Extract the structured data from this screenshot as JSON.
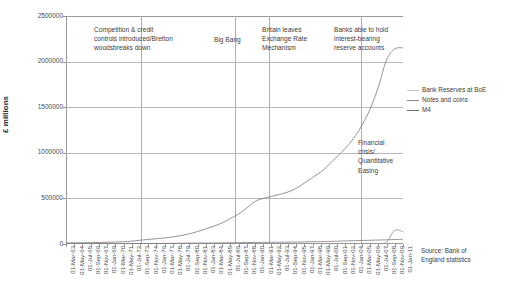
{
  "chart_data": {
    "type": "line",
    "title": "",
    "xlabel": "",
    "ylabel": "£ millions",
    "ylim": [
      0,
      2500000
    ],
    "yticks": [
      "0",
      "500000",
      "1000000",
      "1500000",
      "2000000",
      "2500000"
    ],
    "ytick_values": [
      0,
      500000,
      1000000,
      1500000,
      2000000,
      2500000
    ],
    "grid": "horizontal",
    "legend_position": "right",
    "xticks": [
      "01-Mar-63",
      "01-May-64",
      "01-Jul-65",
      "01-Sep-66",
      "01-Nov-67",
      "01-Jan-69",
      "01-Mar-70",
      "01-May-71",
      "01-Jul-72",
      "01-Sep-73",
      "01-Nov-74",
      "01-Jan-76",
      "01-Mar-77",
      "01-May-78",
      "01-Jul-79",
      "01-Sep-80",
      "01-Nov-81",
      "01-Jan-83",
      "01-Mar-84",
      "01-May-85",
      "01-Jul-86",
      "01-Sep-87",
      "01-Nov-88",
      "01-Jan-90",
      "01-Mar-91",
      "01-May-92",
      "01-Jul-93",
      "01-Sep-94",
      "01-Nov-95",
      "01-Jan-97",
      "01-Mar-98",
      "01-May-99",
      "01-Jul-00",
      "01-Sep-01",
      "01-Nov-02",
      "01-Jan-04",
      "01-Mar-05",
      "01-May-06",
      "01-Jul-07",
      "01-Sep-08",
      "01-Nov-09",
      "01-Jan-11"
    ],
    "series": [
      {
        "name": "Bank Reserves at BoE",
        "color": "#8a8a8a",
        "values": [
          0,
          0,
          0,
          0,
          0,
          0,
          0,
          0,
          0,
          0,
          0,
          0,
          0,
          0,
          0,
          0,
          0,
          0,
          0,
          0,
          0,
          0,
          0,
          0,
          0,
          0,
          0,
          0,
          0,
          0,
          0,
          0,
          0,
          0,
          0,
          0,
          0,
          0,
          0,
          20000,
          150000,
          135000
        ]
      },
      {
        "name": "Notes and coins",
        "color": "#7d7d7d",
        "values": [
          2800,
          3000,
          3100,
          3200,
          3300,
          3500,
          3700,
          3900,
          4200,
          4600,
          5200,
          6000,
          6700,
          7600,
          8600,
          9600,
          10300,
          11200,
          12000,
          12900,
          13800,
          14800,
          16000,
          17200,
          18000,
          18700,
          19500,
          20500,
          21500,
          23000,
          24500,
          26000,
          28000,
          31000,
          33500,
          36000,
          38500,
          41000,
          43500,
          46000,
          49000,
          52000
        ]
      },
      {
        "name": "M4",
        "color": "#7a7a7a",
        "values": [
          11000,
          12500,
          13800,
          15000,
          17000,
          19500,
          22000,
          25000,
          31000,
          41000,
          50000,
          58000,
          66000,
          78000,
          92000,
          112000,
          136000,
          166000,
          196000,
          232000,
          280000,
          330000,
          396000,
          466000,
          500000,
          522000,
          544000,
          570000,
          610000,
          668000,
          730000,
          790000,
          872000,
          960000,
          1050000,
          1160000,
          1300000,
          1480000,
          1720000,
          2020000,
          2140000,
          2150000
        ]
      }
    ],
    "annotations": [
      {
        "text": "Competition & credit\ncontrols introduced/Bretton\nwoodsbreaks down",
        "x_index": 8,
        "label_left": 28,
        "label_top": 9,
        "rule_x_pct": 22.3
      },
      {
        "text": "Big Bang",
        "x_index": 20,
        "label_left": 148,
        "label_top": 19,
        "rule_x_pct": 50.0
      },
      {
        "text": "Britain leaves\nExchange Rate\nMechanism",
        "x_index": 25,
        "label_left": 196,
        "label_top": 9,
        "rule_x_pct": 60.2
      },
      {
        "text": "Banks able to hold\ninterest-bearing\nreserve accounts",
        "x_index": 37,
        "label_left": 268,
        "label_top": 9,
        "rule_x_pct": 87.5
      },
      {
        "text": "Financial crisis/\nQuantitative Easing",
        "x_index": 39,
        "label_left": 292,
        "label_top": 122,
        "rule_x_pct": -1
      }
    ],
    "legend": [
      {
        "label": "Bank Reserves at BoE",
        "color": "#c9c9c9"
      },
      {
        "label": "Notes and coins",
        "color": "#8d8d8d"
      },
      {
        "label": "M4",
        "color": "#6e6e6e"
      }
    ],
    "source_note": "Source: Bank of\nEngland statistics"
  },
  "colors": {
    "background": "#ffffff",
    "axis": "#9a9a9a",
    "grid": "#b9b9b9",
    "text": "#3c3c3c",
    "series_line": "#7a7a7a"
  }
}
